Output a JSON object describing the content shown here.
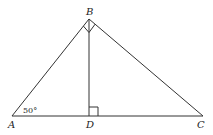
{
  "diagram": {
    "type": "geometry",
    "points": {
      "A": {
        "label": "A",
        "x": 12,
        "y": 116
      },
      "B": {
        "label": "B",
        "x": 89,
        "y": 19
      },
      "C": {
        "label": "C",
        "x": 203,
        "y": 116
      },
      "D": {
        "label": "D",
        "x": 89,
        "y": 116
      }
    },
    "segments": [
      "AB",
      "BC",
      "AC",
      "BD"
    ],
    "right_angles": [
      "ABC",
      "BDC"
    ],
    "angle_annotations": [
      {
        "vertex": "A",
        "text": "50°"
      }
    ]
  }
}
